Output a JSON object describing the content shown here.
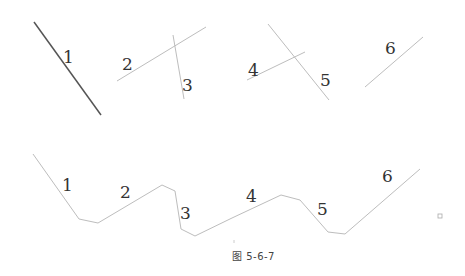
{
  "figure": {
    "caption": "图 5-6-7",
    "colors": {
      "line": "#bdbdbd",
      "line_dark": "#555555",
      "label": "#333333"
    },
    "top_row": {
      "segments": [
        {
          "id": "1",
          "label": "1",
          "x1": 34,
          "y1": 22,
          "x2": 101,
          "y2": 115,
          "lx": 63,
          "ly": 63,
          "dark": true
        },
        {
          "id": "2",
          "label": "2",
          "x1": 117,
          "y1": 81,
          "x2": 206,
          "y2": 27,
          "lx": 122,
          "ly": 70,
          "dark": false
        },
        {
          "id": "3",
          "label": "3",
          "x1": 173,
          "y1": 35,
          "x2": 184,
          "y2": 99,
          "lx": 182,
          "ly": 91,
          "dark": false
        },
        {
          "id": "4",
          "label": "4",
          "x1": 247,
          "y1": 80,
          "x2": 305,
          "y2": 52,
          "lx": 248,
          "ly": 76,
          "dark": false
        },
        {
          "id": "5",
          "label": "5",
          "x1": 268,
          "y1": 24,
          "x2": 329,
          "y2": 100,
          "lx": 320,
          "ly": 86,
          "dark": false
        },
        {
          "id": "6",
          "label": "6",
          "x1": 365,
          "y1": 87,
          "x2": 423,
          "y2": 37,
          "lx": 385,
          "ly": 54,
          "dark": false
        }
      ]
    },
    "bottom_row": {
      "polyline": "33,154 79,219 98,223 162,185 175,191 181,229 195,236 232,218 281,195 300,200 328,232 345,234 420,169",
      "labels": [
        {
          "text": "1",
          "x": 62,
          "y": 191
        },
        {
          "text": "2",
          "x": 120,
          "y": 198
        },
        {
          "text": "3",
          "x": 180,
          "y": 219
        },
        {
          "text": "4",
          "x": 246,
          "y": 202
        },
        {
          "text": "5",
          "x": 317,
          "y": 215
        },
        {
          "text": "6",
          "x": 382,
          "y": 182
        }
      ]
    }
  }
}
